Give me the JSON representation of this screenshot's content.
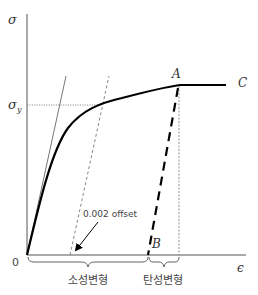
{
  "diagram": {
    "axes": {
      "y_label": "σ",
      "x_label": "ϵ",
      "origin_label": "0",
      "yield_label_main": "σ",
      "yield_label_sub": "y"
    },
    "points": {
      "A": "A",
      "B": "B",
      "C": "C"
    },
    "annotations": {
      "offset": "0.002 offset",
      "plastic_deformation": "소성변형",
      "elastic_deformation": "탄성변형"
    },
    "colors": {
      "curve": "#000000",
      "axis": "#555555",
      "guide": "#777777",
      "text": "#333333"
    }
  }
}
